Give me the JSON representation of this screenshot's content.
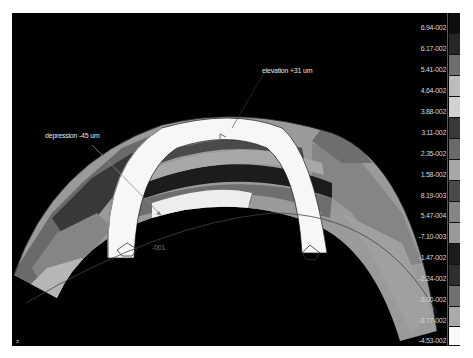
{
  "viewport": {
    "background": "#000000",
    "annotations": {
      "elevation": "elevation +31 um",
      "depression": "depression -45 um",
      "node_label": "-001"
    },
    "corner_mark": "z"
  },
  "legend": {
    "labels": [
      "6.94-002",
      "6.17-002",
      "5.41-002",
      "4.64-002",
      "3.88-002",
      "3.11-002",
      "2.35-002",
      "1.58-002",
      "8.19-003",
      "5.47-004",
      "-7.10-003",
      "-1.47-002",
      "-2.24-002",
      "-3.00-002",
      "-3.77-002",
      "-4.53-002"
    ],
    "swatch_colors": [
      "#0e0e0e",
      "#262626",
      "#6e6e6e",
      "#bcbcbc",
      "#d2d2d2",
      "#383838",
      "#6a6a6a",
      "#a8a8a8",
      "#4a4a4a",
      "#858585",
      "#9a9a9a",
      "#1c1c1c",
      "#2e2e2e",
      "#707070",
      "#aaaaaa",
      "#f8f8f8"
    ]
  }
}
